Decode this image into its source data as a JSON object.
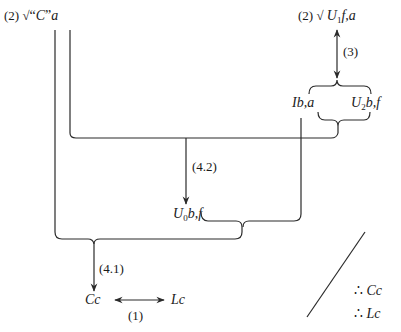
{
  "diagram": {
    "nodes": {
      "top_left": {
        "prefix": "(2) √",
        "quote_open": "“",
        "var": "C",
        "quote_close": "”",
        "suffix": "a"
      },
      "top_right": {
        "prefix": "(2) √ ",
        "var": "U",
        "sub": "1",
        "suffix": "f,a"
      },
      "ib_a": {
        "text": "Ib,a"
      },
      "u2": {
        "var": "U",
        "sub": "2",
        "suffix": "b,f"
      },
      "u0": {
        "var": "U",
        "sub": "0",
        "suffix": "b,f"
      },
      "cc": {
        "text": "Cc"
      },
      "lc": {
        "text": "Lc"
      }
    },
    "edge_labels": {
      "step3": "(3)",
      "step42": "(4.2)",
      "step41": "(4.1)",
      "step1": "(1)"
    },
    "conclusions": [
      {
        "symbol": "∴",
        "text": "Cc"
      },
      {
        "symbol": "∴",
        "text": "Lc"
      }
    ],
    "colors": {
      "stroke": "#2a2a2a",
      "background": "#ffffff"
    }
  }
}
